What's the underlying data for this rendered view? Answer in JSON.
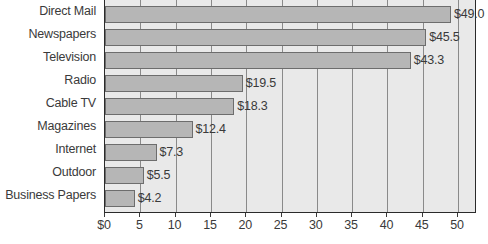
{
  "chart_data": {
    "type": "bar",
    "orientation": "horizontal",
    "title": "",
    "xlabel": "",
    "ylabel": "",
    "categories": [
      "Direct Mail",
      "Newspapers",
      "Television",
      "Radio",
      "Cable TV",
      "Magazines",
      "Internet",
      "Outdoor",
      "Business Papers"
    ],
    "values": [
      49.0,
      45.5,
      43.3,
      19.5,
      18.3,
      12.4,
      7.3,
      5.5,
      4.2
    ],
    "value_labels": [
      "$49.0",
      "$45.5",
      "$43.3",
      "$19.5",
      "$18.3",
      "$12.4",
      "$7.3",
      "$5.5",
      "$4.2"
    ],
    "xlim": [
      0,
      52.7
    ],
    "xticks": [
      0,
      5,
      10,
      15,
      20,
      25,
      30,
      35,
      40,
      45,
      50
    ],
    "xtick_labels": [
      "$0",
      "5",
      "10",
      "15",
      "20",
      "25",
      "30",
      "35",
      "40",
      "45",
      "50"
    ],
    "grid": "vertical",
    "legend": "none",
    "colors": {
      "bar_fill": "#b6b6b6",
      "bar_stroke": "#6d6d6d",
      "plot_background": "#e9e9e9",
      "gridline": "#8a8a8a",
      "frame": "#2b2b2b",
      "text": "#3a3a3a"
    }
  }
}
